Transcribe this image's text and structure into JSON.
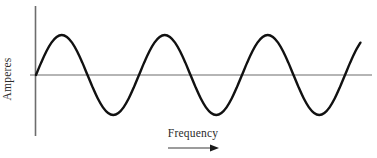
{
  "chart_data": {
    "type": "line",
    "title": "",
    "subtitle": "",
    "xlabel": "Frequency",
    "ylabel": "Amperes",
    "waveform": "sine",
    "cycles": 3,
    "amplitude": 1,
    "period_px": 103,
    "phase": 0,
    "grid": false,
    "legend": null,
    "axis_color": "#6d6d6d",
    "curve_color": "#111111",
    "curve_width_px": 2.4,
    "xlim": [
      0,
      3.2
    ],
    "ylim": [
      -1.18,
      1.18
    ],
    "x_tick_labels": [],
    "y_tick_labels": [],
    "annotations": [
      {
        "name": "direction-arrow",
        "shape": "arrow-right",
        "label": ""
      }
    ],
    "x": [
      0.0,
      0.05,
      0.1,
      0.15,
      0.2,
      0.25,
      0.3,
      0.35,
      0.4,
      0.45,
      0.5,
      0.55,
      0.6,
      0.65,
      0.7,
      0.75,
      0.8,
      0.85,
      0.9,
      0.95,
      1.0,
      1.05,
      1.1,
      1.15,
      1.2,
      1.25,
      1.3,
      1.35,
      1.4,
      1.45,
      1.5,
      1.55,
      1.6,
      1.65,
      1.7,
      1.75,
      1.8,
      1.85,
      1.9,
      1.95,
      2.0,
      2.05,
      2.1,
      2.15,
      2.2,
      2.25,
      2.3,
      2.35,
      2.4,
      2.45,
      2.5,
      2.55,
      2.6,
      2.65,
      2.7,
      2.75,
      2.8,
      2.85,
      2.9,
      2.95,
      3.0,
      3.05,
      3.1,
      3.15,
      3.2
    ],
    "y": [
      0.0,
      0.309,
      0.588,
      0.809,
      0.951,
      1.0,
      0.951,
      0.809,
      0.588,
      0.309,
      0.0,
      -0.309,
      -0.588,
      -0.809,
      -0.951,
      -1.0,
      -0.951,
      -0.809,
      -0.588,
      -0.309,
      0.0,
      0.309,
      0.588,
      0.809,
      0.951,
      1.0,
      0.951,
      0.809,
      0.588,
      0.309,
      0.0,
      -0.309,
      -0.588,
      -0.809,
      -0.951,
      -1.0,
      -0.951,
      -0.809,
      -0.588,
      -0.309,
      0.0,
      0.309,
      0.588,
      0.809,
      0.951,
      1.0,
      0.951,
      0.809,
      0.588,
      0.309,
      0.0,
      -0.309,
      -0.588,
      -0.809,
      -0.951,
      -1.0,
      -0.951,
      -0.809,
      -0.588,
      -0.309,
      0.0,
      0.309,
      0.588,
      0.809,
      0.951,
      1.0
    ]
  }
}
